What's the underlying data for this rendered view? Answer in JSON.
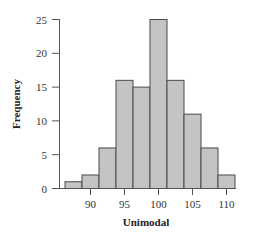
{
  "chart_data": {
    "type": "bar",
    "subtype": "histogram",
    "title": "",
    "xlabel": "Unimodal",
    "ylabel": "Frequency",
    "categories": [
      87.5,
      90,
      92.5,
      95,
      97.5,
      100,
      102.5,
      105,
      107.5,
      110
    ],
    "bin_width": 2.5,
    "values": [
      1,
      2,
      6,
      16,
      15,
      25,
      16,
      11,
      6,
      2
    ],
    "xlim": [
      86.25,
      111.25
    ],
    "ylim": [
      0,
      25
    ],
    "xticks": [
      90,
      95,
      100,
      105,
      110
    ],
    "yticks": [
      0,
      5,
      10,
      15,
      20,
      25
    ],
    "grid": false,
    "legend": null,
    "colors": {
      "bar_fill": "#c4c4c4",
      "bar_edge": "#4a4a4a",
      "axis": "#555555"
    }
  }
}
